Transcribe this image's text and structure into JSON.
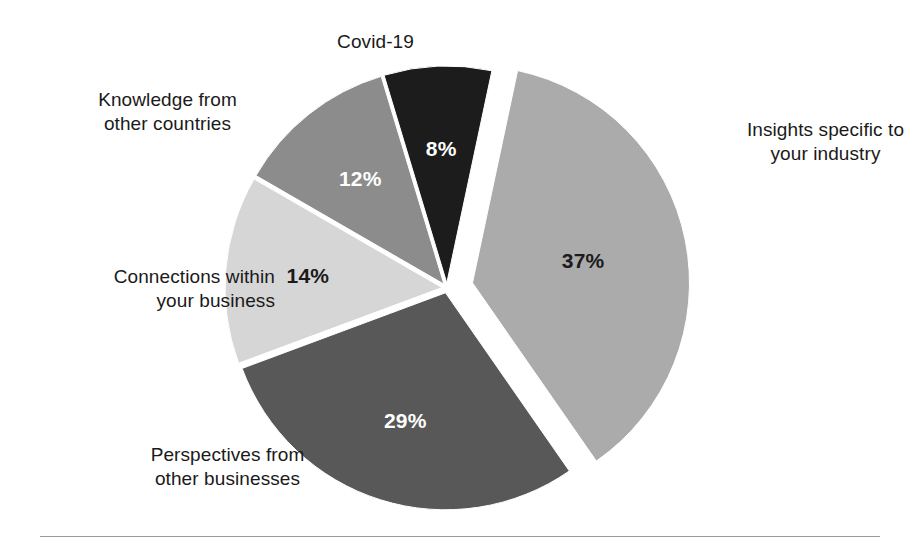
{
  "chart_data": {
    "type": "pie",
    "title": "",
    "subtitle": "",
    "xlabel": "",
    "ylabel": "",
    "legend_position": "none",
    "grid": false,
    "value_suffix": "%",
    "categories": [
      "Insights specific to your industry",
      "Perspectives from other businesses",
      "Connections within your business",
      "Knowledge from other countries",
      "Covid-19"
    ],
    "values": [
      37,
      29,
      14,
      12,
      8
    ],
    "value_labels": [
      "37%",
      "29%",
      "14%",
      "12%",
      "8%"
    ],
    "colors": [
      "#ababab",
      "#585858",
      "#d6d6d6",
      "#8c8c8c",
      "#1c1c1c"
    ],
    "label_text_colors": [
      "#1b1b1b",
      "#ffffff",
      "#1b1b1b",
      "#ffffff",
      "#ffffff"
    ],
    "slices": [
      {
        "name": "insights",
        "label": "Insights specific to\nyour industry",
        "value": 37,
        "value_label": "37%",
        "color": "#ababab",
        "text_color": "dark",
        "exploded": true
      },
      {
        "name": "perspectives",
        "label": "Perspectives from\nother businesses",
        "value": 29,
        "value_label": "29%",
        "color": "#585858",
        "text_color": "light",
        "exploded": false
      },
      {
        "name": "connections",
        "label": "Connections within\nyour business",
        "value": 14,
        "value_label": "14%",
        "color": "#d6d6d6",
        "text_color": "dark",
        "exploded": false
      },
      {
        "name": "knowledge",
        "label": "Knowledge from\nother countries",
        "value": 12,
        "value_label": "12%",
        "color": "#8c8c8c",
        "text_color": "light",
        "exploded": false
      },
      {
        "name": "covid",
        "label": "Covid-19",
        "value": 8,
        "value_label": "8%",
        "color": "#1c1c1c",
        "text_color": "light",
        "exploded": false
      }
    ]
  },
  "labels": {
    "covid": "Covid-19",
    "knowledge": "Knowledge from\nother countries",
    "connections": "Connections within\nyour business",
    "perspectives": "Perspectives from\nother businesses",
    "insights": "Insights specific to\nyour industry"
  },
  "values": {
    "insights": "37%",
    "perspectives": "29%",
    "connections": "14%",
    "knowledge": "12%",
    "covid": "8%"
  }
}
